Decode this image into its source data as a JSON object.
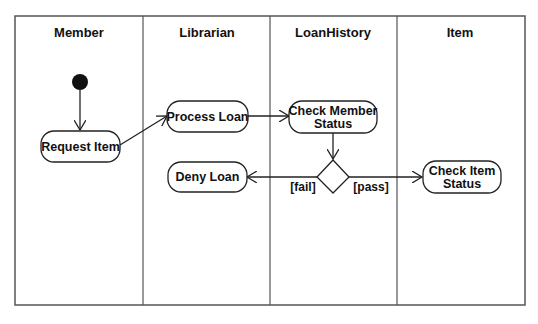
{
  "diagram": {
    "type": "UML activity diagram (swimlanes)",
    "lanes": [
      {
        "label": "Member"
      },
      {
        "label": "Librarian"
      },
      {
        "label": "LoanHistory"
      },
      {
        "label": "Item"
      }
    ],
    "nodes": {
      "request_item": {
        "line1": "Request Item"
      },
      "process_loan": {
        "line1": "Process Loan"
      },
      "check_member": {
        "line1": "Check Member",
        "line2": "Status"
      },
      "deny_loan": {
        "line1": "Deny Loan"
      },
      "check_item": {
        "line1": "Check Item",
        "line2": "Status"
      }
    },
    "guards": {
      "fail": "[fail]",
      "pass": "[pass]"
    },
    "colors": {
      "line": "#222222",
      "frame": "#555555",
      "background": "#ffffff"
    }
  }
}
